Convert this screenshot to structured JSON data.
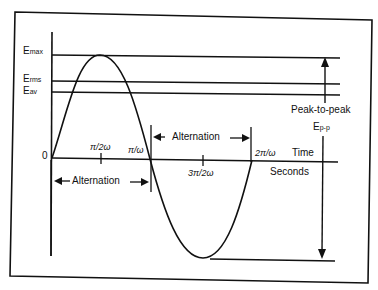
{
  "diagram": {
    "y_labels": {
      "emax": {
        "main": "E",
        "sub": "max"
      },
      "erms": {
        "main": "E",
        "sub": "rms"
      },
      "eav": {
        "main": "E",
        "sub": "av"
      },
      "zero": "0"
    },
    "x_ticks": {
      "pi_2w": "π/2ω",
      "pi_w": "π/ω",
      "three_pi_2w": "3π/2ω",
      "two_pi_w": "2π/ω"
    },
    "axis_labels": {
      "time": "Time",
      "seconds": "Seconds"
    },
    "annotations": {
      "alternation_1": "Alternation",
      "alternation_2": "Alternation",
      "peak_to_peak": "Peak-to-peak",
      "epp_main": "E",
      "epp_sub": "p-p"
    },
    "colors": {
      "line": "#111111",
      "background": "#ffffff"
    }
  }
}
